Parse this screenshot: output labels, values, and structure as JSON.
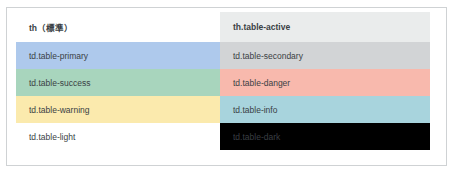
{
  "top_clipped_text": "—  ——— —————",
  "table": {
    "columns": [
      {
        "key": "standard",
        "header": "th（標準）",
        "header_style": "th-std"
      },
      {
        "key": "active",
        "header": "th.table-active",
        "header_style": "th-active"
      }
    ],
    "rows": [
      {
        "left": {
          "label": "td.table-primary",
          "style": "c-primary",
          "color": "#aec9ec"
        },
        "right": {
          "label": "td.table-secondary",
          "style": "c-secondary",
          "color": "#d2d4d6"
        }
      },
      {
        "left": {
          "label": "td.table-success",
          "style": "c-success",
          "color": "#a8d5bd"
        },
        "right": {
          "label": "td.table-danger",
          "style": "c-danger",
          "color": "#f8b9ad"
        }
      },
      {
        "left": {
          "label": "td.table-warning",
          "style": "c-warning",
          "color": "#fbeaad"
        },
        "right": {
          "label": "td.table-info",
          "style": "c-info",
          "color": "#a8d4dd"
        }
      },
      {
        "left": {
          "label": "td.table-light",
          "style": "c-light",
          "color": "#ffffff"
        },
        "right": {
          "label": "td.table-dark",
          "style": "c-dark",
          "color": "#000000"
        }
      }
    ]
  },
  "colors": {
    "frame_border": "#cfd2d4",
    "header_active_bg": "#eaecec",
    "page_bg": "#ffffff",
    "text": "#3a3f44",
    "text_on_dark": "#e8e8e8"
  }
}
